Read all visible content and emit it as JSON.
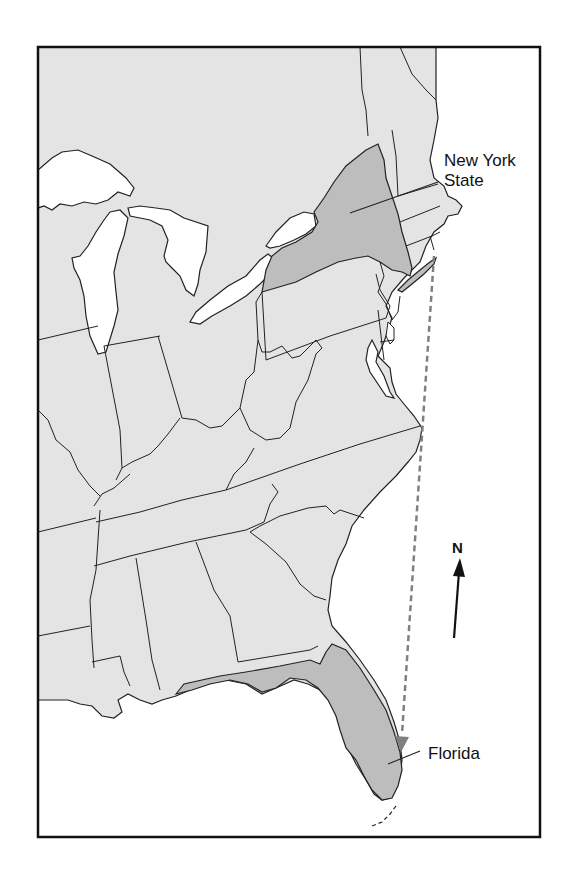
{
  "map": {
    "title": "Eastern United States",
    "colors": {
      "land": "#e4e4e4",
      "highlight": "#bdbdbd",
      "water": "#ffffff",
      "border": "#222222",
      "frame": "#111111",
      "route": "#808080"
    },
    "highlighted_states": [
      {
        "id": "new-york",
        "label": "New York\nState"
      },
      {
        "id": "florida",
        "label": "Florida"
      }
    ],
    "labels": {
      "new_york_line1": "New York",
      "new_york_line2": "State",
      "florida": "Florida"
    },
    "compass": {
      "letter": "N",
      "icon": "north-arrow-icon"
    },
    "route": {
      "from": "New York State",
      "to": "Florida",
      "style": "dashed-arrow"
    }
  }
}
